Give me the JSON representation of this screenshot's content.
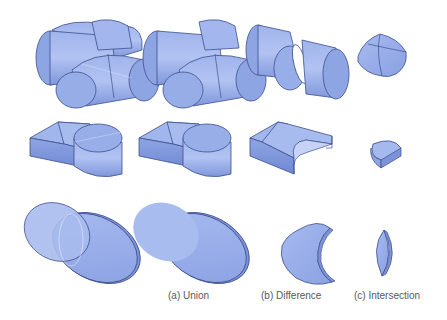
{
  "figure": {
    "colors": {
      "face_light": "#a9bcef",
      "face_mid": "#8fa6e6",
      "face_dark": "#7088d2",
      "edge": "#3e4f8c",
      "cut_face": "#ffffff",
      "background": "#ffffff"
    },
    "rows": [
      {
        "name": "crossed-cylinders"
      },
      {
        "name": "block-with-cylinder"
      },
      {
        "name": "overlapping-discs"
      }
    ],
    "columns": [
      {
        "name": "input-operands",
        "caption": ""
      },
      {
        "name": "union",
        "caption": "(a) Union"
      },
      {
        "name": "difference",
        "caption": "(b) Difference"
      },
      {
        "name": "intersection",
        "caption": "(c) Intersection"
      }
    ]
  }
}
